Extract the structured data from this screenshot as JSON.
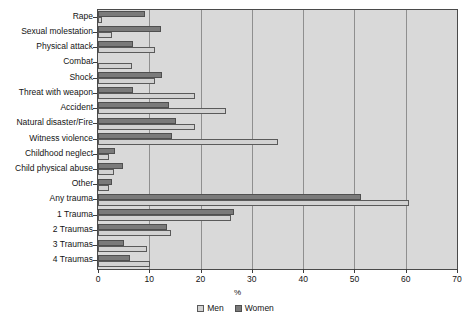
{
  "chart_data": {
    "type": "bar",
    "orientation": "horizontal",
    "title": "",
    "xlabel": "%",
    "ylabel": "",
    "xlim": [
      0,
      70
    ],
    "xticks": [
      0,
      10,
      20,
      30,
      40,
      50,
      60,
      70
    ],
    "grid": true,
    "legend_position": "bottom",
    "categories": [
      "Rape",
      "Sexual molestation",
      "Physical attack",
      "Combat",
      "Shock",
      "Threat with weapon",
      "Accident",
      "Natural disaster/Fire",
      "Witness violence",
      "Childhood neglect",
      "Child physical abuse",
      "Other",
      "Any trauma",
      "1 Trauma",
      "2 Traumas",
      "3 Traumas",
      "4 Traumas"
    ],
    "series": [
      {
        "name": "Men",
        "color": "#d2d2d2",
        "values": [
          0.7,
          2.8,
          11.1,
          6.6,
          11.1,
          19.0,
          25.0,
          18.9,
          35.0,
          2.1,
          3.2,
          2.2,
          60.7,
          26.0,
          14.3,
          9.5,
          10.2
        ]
      },
      {
        "name": "Women",
        "color": "#7a7a7a",
        "values": [
          9.2,
          12.3,
          6.9,
          0.0,
          12.4,
          6.8,
          13.8,
          15.2,
          14.5,
          3.4,
          4.8,
          2.7,
          51.2,
          26.6,
          13.5,
          5.1,
          6.2
        ]
      }
    ]
  },
  "legend": {
    "items": [
      {
        "label": "Men",
        "swatch": "men"
      },
      {
        "label": "Women",
        "swatch": "women"
      }
    ]
  },
  "axis": {
    "x_title": "%"
  }
}
